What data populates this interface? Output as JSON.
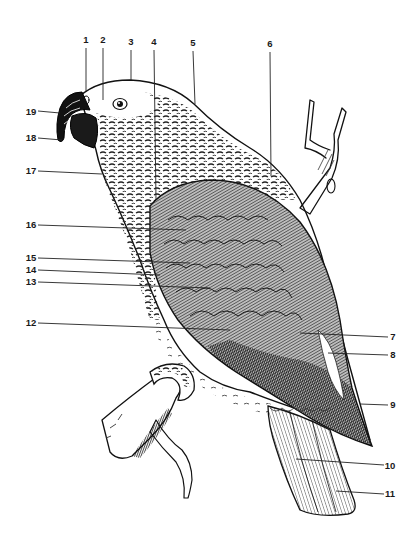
{
  "figure": {
    "labels": [
      {
        "id": "1",
        "text": "1"
      },
      {
        "id": "2",
        "text": "2"
      },
      {
        "id": "3",
        "text": "3"
      },
      {
        "id": "4",
        "text": "4"
      },
      {
        "id": "5",
        "text": "5"
      },
      {
        "id": "6",
        "text": "6"
      },
      {
        "id": "7",
        "text": "7"
      },
      {
        "id": "8",
        "text": "8"
      },
      {
        "id": "9",
        "text": "9"
      },
      {
        "id": "10",
        "text": "10"
      },
      {
        "id": "11",
        "text": "11"
      },
      {
        "id": "12",
        "text": "12"
      },
      {
        "id": "13",
        "text": "13"
      },
      {
        "id": "14",
        "text": "14"
      },
      {
        "id": "15",
        "text": "15"
      },
      {
        "id": "16",
        "text": "16"
      },
      {
        "id": "17",
        "text": "17"
      },
      {
        "id": "18",
        "text": "18"
      },
      {
        "id": "19",
        "text": "19"
      }
    ],
    "colors": {
      "ink": "#111111",
      "paper": "#ffffff",
      "plumage_light": "#d8d8d8",
      "plumage_mid": "#9a9a9a",
      "plumage_dark": "#3a3a3a"
    }
  }
}
